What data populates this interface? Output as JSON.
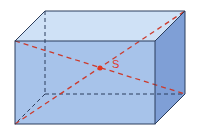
{
  "diagram": {
    "type": "rectangular-cuboid",
    "center_label": "S",
    "colors": {
      "front_face": "#a7c3ea",
      "top_face": "#cfe1f6",
      "right_face": "#7f9fd6",
      "edge": "#2b3d5c",
      "hidden_edge": "#2b3d5c",
      "diagonal": "#cc3a2c",
      "center_point": "#e6351f"
    }
  }
}
